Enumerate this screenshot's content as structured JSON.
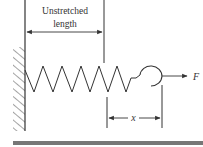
{
  "diagram": {
    "labels": {
      "unstretched_line1": "Unstretched",
      "unstretched_line2": "length",
      "displacement": "x",
      "force": "F"
    },
    "colors": {
      "line": "#333333",
      "ground": "#777777",
      "hatch": "#555555"
    }
  }
}
